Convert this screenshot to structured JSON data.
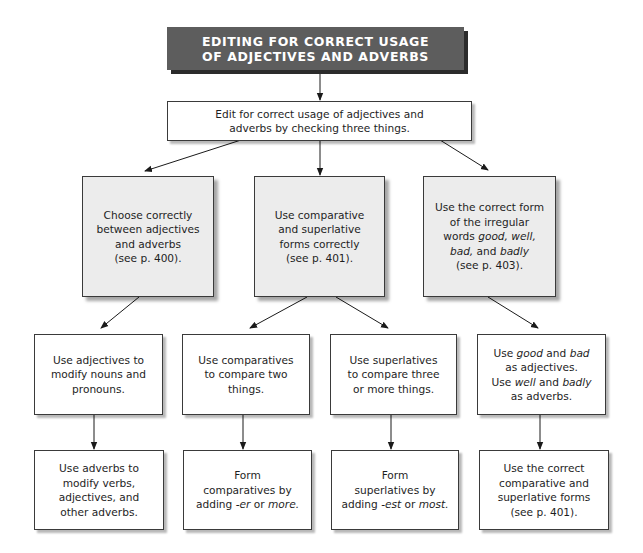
{
  "title": {
    "lines": [
      "EDITING FOR CORRECT USAGE",
      "OF ADJECTIVES AND ADVERBS"
    ],
    "fill_color": "#5d5d5d",
    "shadow_color": "#2b2b2b"
  },
  "root": {
    "lines": [
      "Edit for correct usage of adjectives and",
      "adverbs by checking three things."
    ]
  },
  "level2": [
    {
      "id": "choose",
      "lines": [
        [
          {
            "t": "Choose correctly"
          }
        ],
        [
          {
            "t": "between adjectives"
          }
        ],
        [
          {
            "t": "and adverbs"
          }
        ],
        [
          {
            "t": "(see p. 400)."
          }
        ]
      ]
    },
    {
      "id": "comparative-superlative",
      "lines": [
        [
          {
            "t": "Use comparative"
          }
        ],
        [
          {
            "t": "and superlative"
          }
        ],
        [
          {
            "t": "forms correctly"
          }
        ],
        [
          {
            "t": "(see p. 401)."
          }
        ]
      ]
    },
    {
      "id": "irregular",
      "lines": [
        [
          {
            "t": "Use the correct form"
          }
        ],
        [
          {
            "t": "of the irregular"
          }
        ],
        [
          {
            "t": "words "
          },
          {
            "t": "good, well,",
            "i": true
          }
        ],
        [
          {
            "t": "bad,",
            "i": true
          },
          {
            "t": " and "
          },
          {
            "t": "badly",
            "i": true
          }
        ],
        [
          {
            "t": "(see p. 403)."
          }
        ]
      ]
    }
  ],
  "level3": [
    {
      "id": "adjectives-modify",
      "lines": [
        [
          {
            "t": "Use adjectives to"
          }
        ],
        [
          {
            "t": "modify nouns and"
          }
        ],
        [
          {
            "t": "pronouns."
          }
        ]
      ]
    },
    {
      "id": "comparatives-two",
      "lines": [
        [
          {
            "t": "Use comparatives"
          }
        ],
        [
          {
            "t": "to compare two"
          }
        ],
        [
          {
            "t": "things."
          }
        ]
      ]
    },
    {
      "id": "superlatives-three",
      "lines": [
        [
          {
            "t": "Use superlatives"
          }
        ],
        [
          {
            "t": "to compare three"
          }
        ],
        [
          {
            "t": "or more things."
          }
        ]
      ]
    },
    {
      "id": "good-bad-well-badly",
      "lines": [
        [
          {
            "t": "Use "
          },
          {
            "t": "good",
            "i": true
          },
          {
            "t": " and "
          },
          {
            "t": "bad",
            "i": true
          }
        ],
        [
          {
            "t": "as adjectives."
          }
        ],
        [
          {
            "t": "Use "
          },
          {
            "t": "well",
            "i": true
          },
          {
            "t": " and "
          },
          {
            "t": "badly",
            "i": true
          }
        ],
        [
          {
            "t": "as adverbs."
          }
        ]
      ]
    }
  ],
  "level4": [
    {
      "id": "adverbs-modify",
      "lines": [
        [
          {
            "t": "Use  adverbs to"
          }
        ],
        [
          {
            "t": "modify verbs,"
          }
        ],
        [
          {
            "t": "adjectives, and"
          }
        ],
        [
          {
            "t": "other adverbs."
          }
        ]
      ]
    },
    {
      "id": "form-comparatives",
      "lines": [
        [
          {
            "t": "Form"
          }
        ],
        [
          {
            "t": "comparatives by"
          }
        ],
        [
          {
            "t": "adding "
          },
          {
            "t": "-er",
            "i": true
          },
          {
            "t": " or "
          },
          {
            "t": "more.",
            "i": true
          }
        ]
      ]
    },
    {
      "id": "form-superlatives",
      "lines": [
        [
          {
            "t": "Form"
          }
        ],
        [
          {
            "t": "superlatives by"
          }
        ],
        [
          {
            "t": "adding "
          },
          {
            "t": "-est",
            "i": true
          },
          {
            "t": " or "
          },
          {
            "t": "most.",
            "i": true
          }
        ]
      ]
    },
    {
      "id": "correct-forms",
      "lines": [
        [
          {
            "t": "Use the correct"
          }
        ],
        [
          {
            "t": "comparative and"
          }
        ],
        [
          {
            "t": "superlative forms"
          }
        ],
        [
          {
            "t": "(see p. 401)."
          }
        ]
      ]
    }
  ]
}
